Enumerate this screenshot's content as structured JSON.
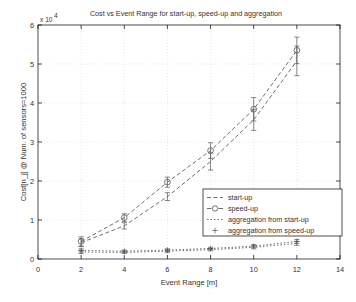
{
  "figure": {
    "title": "Cost vs Event Range for start-up, speed-up and aggregation",
    "exponent_label": "x 10",
    "exponent_sup": "4",
    "xlabel": "Event Range [m]",
    "ylabel": "Cost[n_j] @ Num. of sensors=1000",
    "background": "#ffffff",
    "axis_color": "#000000",
    "grid_color": "#d9d9d9",
    "series_color": "#555555"
  },
  "axes": {
    "x_ticks": [
      "0",
      "2",
      "4",
      "6",
      "8",
      "10",
      "12",
      "14"
    ],
    "y_ticks": [
      "0",
      "1",
      "2",
      "3",
      "4",
      "5",
      "6"
    ]
  },
  "legend": {
    "position": "center-right",
    "items": [
      {
        "label": "start-up",
        "marker": "dashed-line-icon"
      },
      {
        "label": "speed-up",
        "marker": "circle-marker-icon"
      },
      {
        "label": "aggregation from start-up",
        "marker": "dotted-line-icon"
      },
      {
        "label": "aggregation from speed-up",
        "marker": "plus-marker-icon"
      }
    ]
  },
  "chart_data": {
    "type": "line",
    "title": "Cost vs Event Range for start-up, speed-up and aggregation",
    "xlabel": "Event Range [m]",
    "ylabel": "Cost[n_j] @ Num. of sensors=1000",
    "y_multiplier": 10000,
    "xlim": [
      0,
      14
    ],
    "ylim": [
      0,
      6
    ],
    "grid": true,
    "x": [
      2,
      4,
      6,
      8,
      10,
      12
    ],
    "series": [
      {
        "name": "start-up",
        "marker": "dashed-line",
        "values": [
          0.42,
          0.85,
          1.6,
          2.5,
          3.57,
          5.08
        ],
        "err_low": [
          0.1,
          0.08,
          0.1,
          0.22,
          0.27,
          0.38
        ],
        "err_high": [
          0.1,
          0.08,
          0.1,
          0.22,
          0.27,
          0.38
        ]
      },
      {
        "name": "speed-up",
        "marker": "circle",
        "values": [
          0.45,
          1.06,
          1.97,
          2.78,
          3.84,
          5.35
        ],
        "err_low": [
          0.12,
          0.1,
          0.13,
          0.2,
          0.3,
          0.34
        ],
        "err_high": [
          0.12,
          0.1,
          0.13,
          0.2,
          0.3,
          0.34
        ]
      },
      {
        "name": "aggregation from start-up",
        "marker": "dotted-line",
        "values": [
          0.18,
          0.17,
          0.2,
          0.24,
          0.3,
          0.4
        ],
        "err_low": [
          0.04,
          0.03,
          0.03,
          0.03,
          0.04,
          0.05
        ],
        "err_high": [
          0.04,
          0.03,
          0.03,
          0.03,
          0.04,
          0.05
        ]
      },
      {
        "name": "aggregation from speed-up",
        "marker": "plus",
        "values": [
          0.22,
          0.2,
          0.23,
          0.27,
          0.33,
          0.45
        ],
        "err_low": [
          0.04,
          0.03,
          0.03,
          0.03,
          0.04,
          0.05
        ],
        "err_high": [
          0.04,
          0.03,
          0.03,
          0.03,
          0.04,
          0.05
        ]
      }
    ]
  }
}
